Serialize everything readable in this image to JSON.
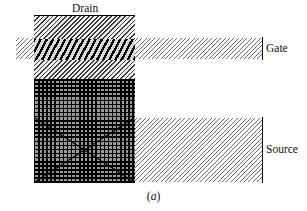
{
  "figure": {
    "caption_open": "(",
    "caption_letter": "a",
    "caption_close": ")",
    "caption_full": "(a)"
  },
  "labels": {
    "drain": "Drain",
    "gate": "Gate",
    "source": "Source"
  },
  "regions": {
    "gate_band": {
      "name": "Gate",
      "fill": "light-diagonal-hatch",
      "color": "#6e6e6e"
    },
    "source_block": {
      "name": "Source",
      "fill": "light-diagonal-hatch",
      "color": "#6e6e6e"
    },
    "drain_column": {
      "name": "Drain",
      "fill": "medium-diagonal-hatch",
      "color": "#3a3a3a"
    },
    "gate_overlap_stripe": {
      "name": "Gate overlap",
      "fill": "bold-diagonal-hatch",
      "color": "#000000"
    },
    "channel_block": {
      "name": "Channel",
      "fill": "dark-cross-hatch-grid",
      "color": "#000000"
    }
  },
  "colors": {
    "background": "#ffffff",
    "ink": "#111111",
    "hatch_light": "#6e6e6e",
    "hatch_medium": "#3a3a3a",
    "hatch_bold": "#000000",
    "hatch_grid": "#000000",
    "grid_base": "#9a9a9a"
  }
}
